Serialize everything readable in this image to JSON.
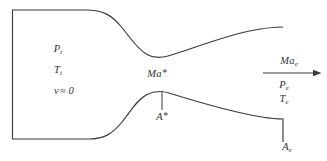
{
  "figure": {
    "background": "#ffffff",
    "line_color": "#3a3a3a",
    "labels": {
      "chamber_pressure": {
        "base": "P",
        "sub": "t"
      },
      "chamber_temperature": {
        "base": "T",
        "sub": "t"
      },
      "chamber_velocity": {
        "base": "v",
        "rest": "≈ 0"
      },
      "throat_mach": {
        "base": "Ma",
        "sup": "*"
      },
      "throat_area": {
        "base": "A",
        "sup": "*"
      },
      "exit_mach": {
        "base": "Ma",
        "sub": "e"
      },
      "exit_pressure": {
        "base": "P",
        "sub": "e"
      },
      "exit_temperature": {
        "base": "T",
        "sub": "e"
      },
      "exit_area": {
        "base": "A",
        "sub": "e"
      }
    }
  }
}
